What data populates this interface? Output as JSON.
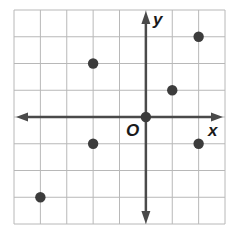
{
  "chart_data": {
    "type": "scatter",
    "title": "",
    "xlabel": "x",
    "ylabel": "y",
    "origin_label": "O",
    "xlim": [
      -5,
      3
    ],
    "ylim": [
      -4,
      4
    ],
    "grid": true,
    "legend": null,
    "tick_labels_shown": false,
    "points": [
      {
        "x": -2,
        "y": 2
      },
      {
        "x": 2,
        "y": 3
      },
      {
        "x": 1,
        "y": 1
      },
      {
        "x": 0,
        "y": 0
      },
      {
        "x": -2,
        "y": -1
      },
      {
        "x": 2,
        "y": -1
      },
      {
        "x": -4,
        "y": -3
      }
    ]
  },
  "colors": {
    "grid": "#b8b8b8",
    "axis": "#4a4a4a",
    "point": "#3c3c3c",
    "label": "#1a1a1a"
  },
  "labels": {
    "x": "x",
    "y": "y",
    "origin": "O"
  }
}
